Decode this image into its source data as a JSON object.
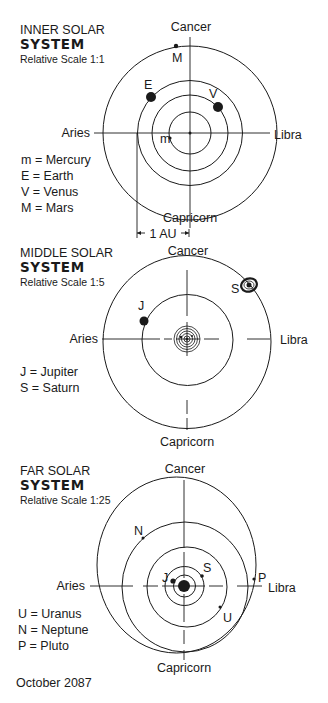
{
  "date": "October 2087",
  "style": {
    "ink": "#1a1a1a",
    "paper": "#ffffff"
  },
  "panels": [
    {
      "id": "inner",
      "title_line1": "INNER SOLAR",
      "title_line2": "SYSTEM",
      "scale_label": "Relative Scale 1:1",
      "title_pos": [
        20,
        34
      ],
      "center": [
        190,
        133
      ],
      "signs": {
        "top": {
          "label": "Cancer",
          "pos": [
            191,
            31
          ]
        },
        "bottom": {
          "label": "Capricorn",
          "pos": [
            190,
            222
          ]
        },
        "left": {
          "label": "Aries",
          "pos": [
            90,
            137
          ]
        },
        "right": {
          "label": "Libra",
          "pos": [
            274,
            139
          ]
        }
      },
      "axes": {
        "v": [
          [
            190,
            37,
            190,
            228
          ]
        ],
        "h": [
          [
            94,
            133,
            270,
            133
          ]
        ]
      },
      "sun": {
        "r": 1.5
      },
      "orbits": [
        {
          "name": "Mercury",
          "cx": 190,
          "cy": 133,
          "rx": 21,
          "ry": 21
        },
        {
          "name": "Venus",
          "cx": 190,
          "cy": 133,
          "rx": 38,
          "ry": 38
        },
        {
          "name": "Earth",
          "cx": 190,
          "cy": 133,
          "rx": 52.5,
          "ry": 52.5
        },
        {
          "name": "Mars",
          "cx": 190,
          "cy": 133,
          "rx": 87,
          "ry": 87
        }
      ],
      "planets": [
        {
          "symbol": "m",
          "name": "Mercury",
          "x": 170,
          "y": 138,
          "r": 1.6,
          "label_pos": [
            160,
            143
          ]
        },
        {
          "symbol": "V",
          "name": "Venus",
          "x": 218,
          "y": 107,
          "r": 5,
          "label_pos": [
            209,
            98
          ]
        },
        {
          "symbol": "E",
          "name": "Earth",
          "x": 151,
          "y": 97,
          "r": 5,
          "label_pos": [
            144,
            89
          ]
        },
        {
          "symbol": "M",
          "name": "Mars",
          "x": 176,
          "y": 46,
          "r": 2.2,
          "label_pos": [
            172,
            62
          ]
        }
      ],
      "legend": [
        {
          "text": "m = Mercury"
        },
        {
          "text": "E = Earth"
        },
        {
          "text": "V = Venus"
        },
        {
          "text": "M = Mars"
        }
      ],
      "legend_pos": [
        21,
        164
      ],
      "scale_bar": {
        "label": "1 AU",
        "x1": 137,
        "x2": 189,
        "y": 233,
        "left_line_top": 133
      }
    },
    {
      "id": "middle",
      "title_line1": "MIDDLE SOLAR",
      "title_line2": "SYSTEM",
      "scale_label": "Relative Scale 1:5",
      "title_pos": [
        20,
        257
      ],
      "center": [
        187,
        339
      ],
      "signs": {
        "top": {
          "label": "Cancer",
          "pos": [
            188,
            255
          ]
        },
        "bottom": {
          "label": "Capricorn",
          "pos": [
            187,
            446
          ]
        },
        "left": {
          "label": "Aries",
          "pos": [
            98,
            343
          ]
        },
        "right": {
          "label": "Libra",
          "pos": [
            280,
            344
          ]
        }
      },
      "axes": {
        "v": [
          [
            187,
            270,
            187,
            316
          ],
          [
            187,
            322,
            187,
            356
          ],
          [
            187,
            400,
            187,
            414
          ],
          [
            187,
            418,
            187,
            430
          ]
        ],
        "h": [
          [
            102,
            339,
            160,
            339
          ],
          [
            164,
            339,
            172,
            339
          ],
          [
            176,
            339,
            200,
            339
          ],
          [
            204,
            339,
            219,
            339
          ],
          [
            247,
            339,
            270,
            339
          ]
        ]
      },
      "sun": {
        "r": 1.5
      },
      "mini_rings": [
        3,
        5.5,
        8,
        10.5,
        13
      ],
      "orbits": [
        {
          "name": "Jupiter",
          "cx": 187.5,
          "cy": 340,
          "rx": 45.5,
          "ry": 45.5
        },
        {
          "name": "Saturn",
          "cx": 187,
          "cy": 342,
          "rx": 84,
          "ry": 86.5
        }
      ],
      "planets": [
        {
          "symbol": "J",
          "name": "Jupiter",
          "x": 144,
          "y": 321,
          "r": 4.5,
          "label_pos": [
            138,
            310
          ]
        },
        {
          "symbol": "S",
          "name": "Saturn",
          "x": 249,
          "y": 285,
          "r": 2.5,
          "label_pos": [
            231,
            293
          ],
          "ring": true
        }
      ],
      "legend": [
        {
          "text": "J = Jupiter"
        },
        {
          "text": "S = Saturn"
        }
      ],
      "legend_pos": [
        20,
        376
      ]
    },
    {
      "id": "far",
      "title_line1": "FAR SOLAR",
      "title_line2": "SYSTEM",
      "scale_label": "Relative Scale 1:25",
      "title_pos": [
        20,
        475
      ],
      "center": [
        184,
        586
      ],
      "signs": {
        "top": {
          "label": "Cancer",
          "pos": [
            185,
            473
          ]
        },
        "bottom": {
          "label": "Capricorn",
          "pos": [
            184,
            672
          ]
        },
        "left": {
          "label": "Aries",
          "pos": [
            85,
            590
          ]
        },
        "right": {
          "label": "Libra",
          "pos": [
            268,
            592
          ]
        }
      },
      "axes": {
        "v": [
          [
            184,
            480,
            184,
            548
          ],
          [
            184,
            552,
            184,
            578
          ],
          [
            184,
            594,
            184,
            622
          ],
          [
            184,
            630,
            184,
            644
          ],
          [
            184,
            650,
            184,
            660
          ]
        ],
        "h": [
          [
            90,
            586,
            133,
            586
          ],
          [
            143,
            586,
            158,
            586
          ],
          [
            162,
            586,
            205,
            586
          ],
          [
            209,
            586,
            223,
            586
          ],
          [
            237,
            586,
            262,
            586
          ]
        ]
      },
      "sun": {
        "r": 6
      },
      "orbits": [
        {
          "name": "Jupiter",
          "cx": 184.5,
          "cy": 586,
          "rx": 11,
          "ry": 11
        },
        {
          "name": "Saturn",
          "cx": 184.5,
          "cy": 586,
          "rx": 19.5,
          "ry": 19.5
        },
        {
          "name": "Uranus",
          "cx": 187,
          "cy": 587,
          "rx": 40,
          "ry": 40
        },
        {
          "name": "Neptune",
          "cx": 185,
          "cy": 587,
          "rx": 63,
          "ry": 65
        },
        {
          "name": "Pluto",
          "cx": 176.5,
          "cy": 565,
          "rx": 79.5,
          "ry": 88
        }
      ],
      "planets": [
        {
          "symbol": "J",
          "name": "Jupiter",
          "x": 173,
          "y": 581,
          "r": 2.6,
          "label_pos": [
            162,
            582
          ]
        },
        {
          "symbol": "S",
          "name": "Saturn",
          "x": 202,
          "y": 576,
          "r": 1.8,
          "label_pos": [
            203,
            572
          ]
        },
        {
          "symbol": "U",
          "name": "Uranus",
          "x": 220,
          "y": 607,
          "r": 1.5,
          "label_pos": [
            223,
            622
          ]
        },
        {
          "symbol": "N",
          "name": "Neptune",
          "x": 143,
          "y": 538,
          "r": 1.5,
          "label_pos": [
            134,
            535
          ]
        },
        {
          "symbol": "P",
          "name": "Pluto",
          "x": 254,
          "y": 579,
          "r": 1.6,
          "label_pos": [
            258,
            582
          ]
        }
      ],
      "legend": [
        {
          "text": "U = Uranus"
        },
        {
          "text": "N = Neptune"
        },
        {
          "text": "P = Pluto"
        }
      ],
      "legend_pos": [
        18,
        618
      ]
    }
  ]
}
